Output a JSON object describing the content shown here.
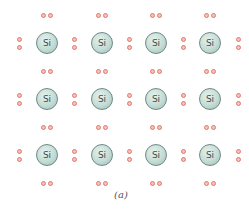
{
  "figure": {
    "caption": "(a)",
    "atom_label": "Si",
    "rows": 3,
    "columns": 4,
    "atom_centers_x": [
      47,
      102,
      156,
      210
    ],
    "atom_centers_y": [
      43,
      99,
      155
    ],
    "colors": {
      "atom_fill": "#c3dcd5",
      "atom_border": "#6f8a84",
      "electron_ring": "#e27a70",
      "electron_fill": "#f4c1b9"
    },
    "atoms": [
      {
        "row": 0,
        "col": 0,
        "label": "Si"
      },
      {
        "row": 0,
        "col": 1,
        "label": "Si"
      },
      {
        "row": 0,
        "col": 2,
        "label": "Si"
      },
      {
        "row": 0,
        "col": 3,
        "label": "Si"
      },
      {
        "row": 1,
        "col": 0,
        "label": "Si"
      },
      {
        "row": 1,
        "col": 1,
        "label": "Si"
      },
      {
        "row": 1,
        "col": 2,
        "label": "Si"
      },
      {
        "row": 1,
        "col": 3,
        "label": "Si"
      },
      {
        "row": 2,
        "col": 0,
        "label": "Si"
      },
      {
        "row": 2,
        "col": 1,
        "label": "Si"
      },
      {
        "row": 2,
        "col": 2,
        "label": "Si"
      },
      {
        "row": 2,
        "col": 3,
        "label": "Si"
      }
    ]
  }
}
